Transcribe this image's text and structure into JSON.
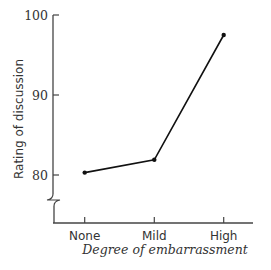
{
  "chart_data": {
    "type": "line",
    "title": "",
    "xlabel": "Degree of embarrassment",
    "ylabel": "Rating of discussion",
    "categories": [
      "None",
      "Mild",
      "High"
    ],
    "series": [
      {
        "name": "Rating of discussion",
        "values": [
          80.3,
          81.9,
          97.5
        ]
      }
    ],
    "yticks": [
      80,
      90,
      100
    ],
    "ylim": [
      80,
      100
    ],
    "axis_break": true,
    "grid": false,
    "legend": null,
    "colors": {
      "line": "#111111",
      "axis": "#444444",
      "text": "#333333"
    }
  }
}
